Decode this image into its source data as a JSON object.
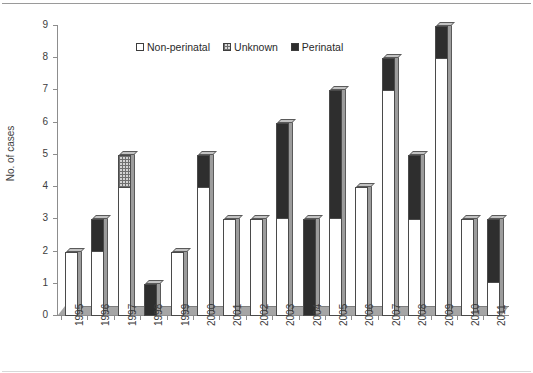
{
  "chart_data": {
    "type": "bar",
    "title": "",
    "xlabel": "",
    "ylabel": "No. of cases",
    "ylim": [
      0,
      9
    ],
    "ytick_labels": [
      "0",
      "1",
      "2",
      "3",
      "4",
      "5",
      "6",
      "7",
      "8",
      "9"
    ],
    "grid": false,
    "stacked": true,
    "legend_position": "top-center",
    "categories": [
      "1995",
      "1996",
      "1997",
      "1998",
      "1999",
      "2000",
      "2001",
      "2002",
      "2003",
      "2004",
      "2005",
      "2006",
      "2007",
      "2008",
      "2009",
      "2010",
      "2011"
    ],
    "series": [
      {
        "name": "Non-perinatal",
        "color": "#ffffff",
        "values": [
          2,
          2,
          4,
          0,
          2,
          4,
          3,
          3,
          3,
          0,
          3,
          4,
          7,
          3,
          8,
          3,
          1
        ]
      },
      {
        "name": "Unknown",
        "color": "#d3d3d3",
        "values": [
          0,
          0,
          1,
          0,
          0,
          0,
          0,
          0,
          0,
          0,
          0,
          0,
          0,
          0,
          0,
          0,
          0
        ]
      },
      {
        "name": "Perinatal",
        "color": "#2e2e2e",
        "values": [
          0,
          1,
          0,
          1,
          0,
          1,
          0,
          0,
          3,
          3,
          4,
          0,
          1,
          2,
          1,
          0,
          2
        ]
      }
    ],
    "totals": [
      2,
      3,
      5,
      1,
      2,
      5,
      3,
      3,
      6,
      3,
      7,
      4,
      8,
      5,
      9,
      3,
      3
    ]
  },
  "legend": {
    "items": [
      {
        "label": "Non-perinatal",
        "swatch": "non-perinatal"
      },
      {
        "label": "Unknown",
        "swatch": "unknown"
      },
      {
        "label": "Perinatal",
        "swatch": "perinatal"
      }
    ]
  }
}
